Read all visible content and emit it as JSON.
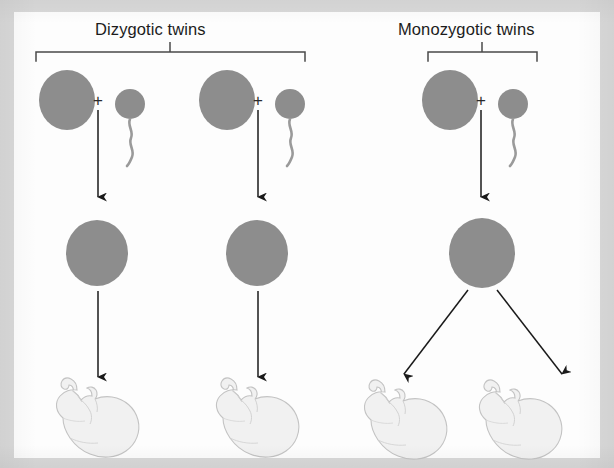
{
  "figure": {
    "kind": "biology-diagram",
    "width": 614,
    "height": 468,
    "page_background": "#fdfdfd",
    "frame_background": "#d9d9d9"
  },
  "palette": {
    "cell_gray": "#8d8d8d",
    "cell_gray_edge": "#7e7e7e",
    "fetus_fill": "#f1f1f1",
    "fetus_outline": "#c3c3c3",
    "line_black": "#1a1a1a",
    "bracket_gray": "#4a4a4a",
    "text_black": "#1c1c1c"
  },
  "groups": [
    {
      "id": "dizygotic",
      "label": "Dizygotic twins",
      "bracket": {
        "left": 36,
        "right": 305,
        "y": 52,
        "stem_x": 170,
        "tick": 9
      },
      "label_x": 95,
      "label_y": 21
    },
    {
      "id": "monozygotic",
      "label": "Monozygotic twins",
      "bracket": {
        "left": 428,
        "right": 537,
        "y": 52,
        "stem_x": 482,
        "tick": 9
      },
      "label_x": 398,
      "label_y": 21
    }
  ],
  "columns": [
    {
      "id": "dizygotic-left",
      "group": "dizygotic",
      "egg": {
        "cx": 67,
        "cy": 100,
        "rx": 28,
        "ry": 30
      },
      "plus": {
        "x": 98,
        "y": 93
      },
      "sperm": {
        "cx": 130,
        "cy": 104,
        "r": 15
      },
      "arrow_fertilize": {
        "x": 98,
        "y1": 110,
        "y2": 195
      },
      "zygote": {
        "cx": 97,
        "cy": 253,
        "rx": 31,
        "ry": 33
      },
      "arrow_develop": {
        "x": 98,
        "y1": 290,
        "y2": 375
      },
      "fetus": {
        "x": 50,
        "y": 372,
        "scale": 1.0
      }
    },
    {
      "id": "dizygotic-right",
      "group": "dizygotic",
      "egg": {
        "cx": 227,
        "cy": 100,
        "rx": 28,
        "ry": 30
      },
      "plus": {
        "x": 258,
        "y": 93
      },
      "sperm": {
        "cx": 290,
        "cy": 104,
        "r": 15
      },
      "arrow_fertilize": {
        "x": 258,
        "y1": 110,
        "y2": 195
      },
      "zygote": {
        "cx": 257,
        "cy": 253,
        "rx": 31,
        "ry": 33
      },
      "arrow_develop": {
        "x": 258,
        "y1": 290,
        "y2": 375
      },
      "fetus": {
        "x": 210,
        "y": 372,
        "scale": 1.0
      }
    },
    {
      "id": "monozygotic",
      "group": "monozygotic",
      "egg": {
        "cx": 450,
        "cy": 100,
        "rx": 28,
        "ry": 30
      },
      "plus": {
        "x": 481,
        "y": 93
      },
      "sperm": {
        "cx": 513,
        "cy": 104,
        "r": 15
      },
      "arrow_fertilize": {
        "x": 481,
        "y1": 110,
        "y2": 195
      },
      "zygote": {
        "cx": 482,
        "cy": 253,
        "rx": 33,
        "ry": 35
      },
      "split_arrow_left": {
        "x1": 466,
        "y1": 291,
        "x2": 400,
        "y2": 372
      },
      "split_arrow_right": {
        "x1": 498,
        "y1": 291,
        "x2": 566,
        "y2": 372
      },
      "fetus_left": {
        "x": 355,
        "y": 372,
        "scale": 0.95
      },
      "fetus_right": {
        "x": 470,
        "y": 372,
        "scale": 0.95
      }
    }
  ],
  "symbols": {
    "plus": "+"
  }
}
